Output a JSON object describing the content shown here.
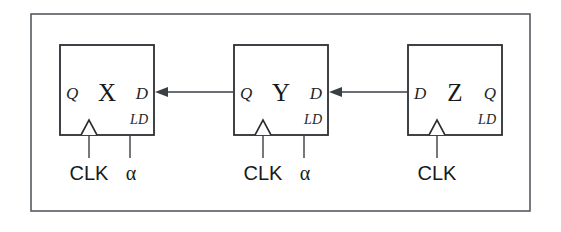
{
  "figure": {
    "kind": "digital-logic-schematic",
    "background_color": "#ffffff",
    "frame_stroke_color": "#555b60",
    "box_stroke_color": "#2b2f33",
    "wire_color": "#3a3f44",
    "text_color": "#16191c"
  },
  "flipflops": [
    {
      "id": "ff-x",
      "name": "X",
      "left_port": "Q",
      "right_port": "D",
      "enable_label": "LD",
      "clock_label": "CLK",
      "load_label": "α",
      "has_load_input": true
    },
    {
      "id": "ff-y",
      "name": "Y",
      "left_port": "Q",
      "right_port": "D",
      "enable_label": "LD",
      "clock_label": "CLK",
      "load_label": "α",
      "has_load_input": true
    },
    {
      "id": "ff-z",
      "name": "Z",
      "left_port": "D",
      "right_port": "Q",
      "enable_label": "LD",
      "clock_label": "CLK",
      "load_label": "",
      "has_load_input": false
    }
  ],
  "connections": [
    {
      "id": "wire-y-to-x",
      "from": "ff-y",
      "from_port": "Q",
      "to": "ff-x",
      "to_port": "D",
      "direction": "right-to-left"
    },
    {
      "id": "wire-z-to-y",
      "from": "ff-z",
      "from_port": "D",
      "to": "ff-y",
      "to_port": "D",
      "direction": "right-to-left"
    }
  ]
}
